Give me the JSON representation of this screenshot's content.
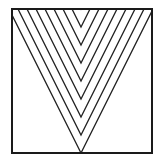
{
  "figure": {
    "canvas": {
      "width": 159,
      "height": 165
    },
    "frame": {
      "x": 12,
      "y": 9,
      "width": 140,
      "height": 144
    },
    "center_x": 81,
    "slope": 2.0,
    "line_spacing_y": 18,
    "vertex_y_first": 27,
    "extra_lines": 8,
    "colors": {
      "background": "#ffffff",
      "frame_stroke": "#1a1a1a",
      "line_stroke": "#222222"
    },
    "frame_stroke_width": 2,
    "line_stroke_width": 1.3
  }
}
